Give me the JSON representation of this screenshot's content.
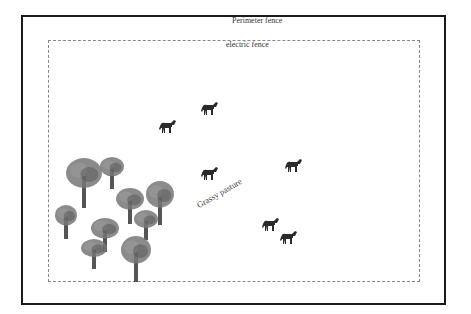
{
  "diagram": {
    "perimeter_fence": {
      "label": "Perimeter fence"
    },
    "electric_fence": {
      "label": "electric fence"
    },
    "pasture": {
      "label": "Grassy pasture"
    },
    "colors": {
      "fence": "#1a1a1a",
      "electric": "#888888",
      "horse": "#2a2a2a",
      "tree_canopy": "#777777",
      "tree_trunk": "#555555"
    },
    "horses": [
      {
        "x": 158,
        "y": 118
      },
      {
        "x": 200,
        "y": 100
      },
      {
        "x": 200,
        "y": 165
      },
      {
        "x": 284,
        "y": 157
      },
      {
        "x": 261,
        "y": 216
      },
      {
        "x": 279,
        "y": 229
      }
    ],
    "trees": [
      {
        "x": 66,
        "y": 158,
        "w": 36,
        "h": 50
      },
      {
        "x": 100,
        "y": 157,
        "w": 24,
        "h": 32
      },
      {
        "x": 55,
        "y": 205,
        "w": 22,
        "h": 34
      },
      {
        "x": 116,
        "y": 188,
        "w": 28,
        "h": 36
      },
      {
        "x": 146,
        "y": 181,
        "w": 28,
        "h": 44
      },
      {
        "x": 91,
        "y": 218,
        "w": 28,
        "h": 34
      },
      {
        "x": 134,
        "y": 210,
        "w": 24,
        "h": 30
      },
      {
        "x": 81,
        "y": 239,
        "w": 26,
        "h": 30
      },
      {
        "x": 121,
        "y": 236,
        "w": 30,
        "h": 46
      }
    ]
  }
}
